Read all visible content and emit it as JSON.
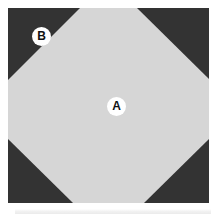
{
  "figure": {
    "caption_visible": false,
    "panel_count": 1,
    "plate": {
      "name": "octagon-plate",
      "width_px": 201,
      "height_px": 195,
      "background_color": "#d6d6d6",
      "corner_color": "#333333",
      "corner_cut_px": 72,
      "shape": "octagon",
      "description": "light gray octagon formed by a square with four dark corner triangles"
    },
    "labels": [
      {
        "id": "A",
        "text": "A",
        "region": "center-octagon",
        "x_px": 108,
        "y_px": 98,
        "marker": "white-circle",
        "text_color": "#111111",
        "marker_color": "#ffffff"
      },
      {
        "id": "B",
        "text": "B",
        "region": "top-left-corner-triangle",
        "x_px": 33,
        "y_px": 28,
        "marker": "white-circle",
        "text_color": "#111111",
        "marker_color": "#ffffff"
      }
    ],
    "corners": [
      {
        "name": "top-left",
        "color": "#333333"
      },
      {
        "name": "top-right",
        "color": "#333333"
      },
      {
        "name": "bottom-left",
        "color": "#333333"
      },
      {
        "name": "bottom-right",
        "color": "#333333"
      }
    ],
    "colors": {
      "light_region": "#d6d6d6",
      "dark_region": "#333333",
      "label_marker": "#ffffff",
      "label_text": "#111111",
      "page_background": "#ffffff",
      "next_panel_edge": "#ebebeb"
    }
  }
}
